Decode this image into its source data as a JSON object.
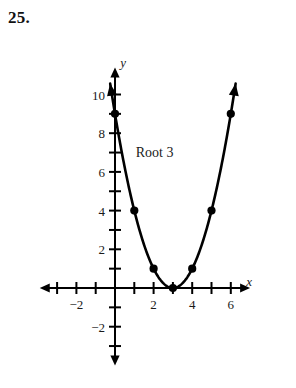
{
  "problem": {
    "number_label": "25."
  },
  "annotation": {
    "text": "Root 3",
    "x_data": 2.05,
    "y_data": 7.0
  },
  "axes": {
    "x_axis_name": "x",
    "y_axis_name": "y",
    "x_name_pos": {
      "x_data": 6.95,
      "y_data": 0.35
    },
    "y_name_pos": {
      "x_data": 0.42,
      "y_data": 11.7
    },
    "x_tick_labels": [
      {
        "value": -2,
        "text": "−2"
      },
      {
        "value": 2,
        "text": "2"
      },
      {
        "value": 4,
        "text": "4"
      },
      {
        "value": 6,
        "text": "6"
      }
    ],
    "y_tick_labels": [
      {
        "value": 10,
        "text": "10"
      },
      {
        "value": 8,
        "text": "8"
      },
      {
        "value": 6,
        "text": "6"
      },
      {
        "value": 4,
        "text": "4"
      },
      {
        "value": 2,
        "text": "2"
      },
      {
        "value": -2,
        "text": "−2"
      }
    ],
    "x_ticks": [
      -3,
      -2,
      -1,
      1,
      2,
      3,
      4,
      5,
      6
    ],
    "y_ticks": [
      1,
      2,
      3,
      4,
      5,
      6,
      7,
      8,
      9,
      10,
      -1,
      -2,
      -3
    ],
    "x_range": [
      -3.9,
      7.0
    ],
    "y_range": [
      -4.0,
      11.4
    ],
    "stroke_color": "#000000",
    "axis_line_width": 2.0,
    "tick_half_length": 6
  },
  "chart_data": {
    "type": "line",
    "title": "",
    "subtitle": "",
    "xlabel": "x",
    "ylabel": "y",
    "xlim": [
      -3.9,
      7.0
    ],
    "ylim": [
      -4.0,
      11.4
    ],
    "grid": false,
    "legend": "none",
    "curve_color": "#000000",
    "curve_width": 2.6,
    "marker_color": "#000000",
    "marker_radius": 4.1,
    "equation": "y = (x - 3)^2",
    "vertex": [
      3,
      0
    ],
    "root": 3,
    "series": [
      {
        "name": "y = (x - 3)^2",
        "points": [
          {
            "x": 0,
            "y": 9
          },
          {
            "x": 1,
            "y": 4
          },
          {
            "x": 2,
            "y": 1
          },
          {
            "x": 3,
            "y": 0
          },
          {
            "x": 4,
            "y": 1
          },
          {
            "x": 5,
            "y": 4
          },
          {
            "x": 6,
            "y": 9
          }
        ]
      }
    ],
    "curve_extent": {
      "x_start": -0.25,
      "x_end": 6.25
    },
    "arrow_ends": [
      "left-branch-up",
      "right-branch-up"
    ],
    "annotations": [
      {
        "text": "Root 3",
        "x": 2.05,
        "y": 7.0
      }
    ]
  }
}
